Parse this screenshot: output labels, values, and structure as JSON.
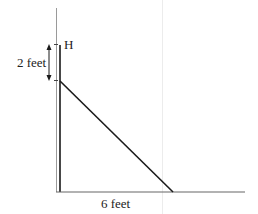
{
  "diagram": {
    "labels": {
      "height_label": "H",
      "vertical_dimension": "2 feet",
      "horizontal_dimension": "6 feet"
    },
    "colors": {
      "line": "#1a1a1a",
      "guide": "#9a9a9a",
      "faint": "#e6e6e6"
    }
  }
}
